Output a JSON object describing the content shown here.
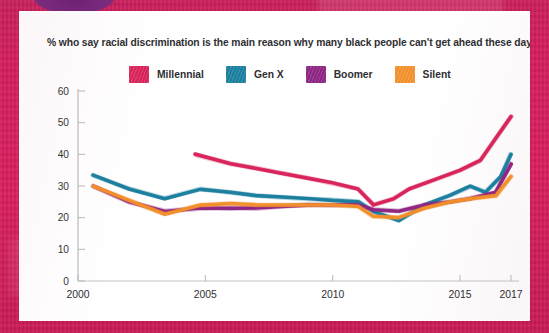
{
  "chart_data": {
    "type": "line",
    "title": "% who say racial discrimination is the main reason why many black people can't get ahead these days",
    "xlabel": "",
    "ylabel": "",
    "xlim": [
      2000,
      2017
    ],
    "ylim": [
      0,
      60
    ],
    "grid": false,
    "legend_position": "top",
    "y_ticks": [
      "60",
      "50",
      "40",
      "30",
      "20",
      "10",
      "0"
    ],
    "y_tick_values": [
      60,
      50,
      40,
      30,
      20,
      10,
      0
    ],
    "x_ticks": [
      "2000",
      "2005",
      "2010",
      "2015",
      "2017"
    ],
    "x_tick_values": [
      2000,
      2005,
      2010,
      2015,
      2017
    ],
    "series": [
      {
        "name": "Millennial",
        "color": "#d8235a",
        "x": [
          2004.6,
          2006,
          2007,
          2008,
          2009,
          2010,
          2011,
          2011.6,
          2012.4,
          2013,
          2014,
          2015,
          2015.8,
          2016.4,
          2017
        ],
        "values": [
          40,
          37,
          35.5,
          34,
          32.5,
          31,
          29,
          24,
          26,
          29,
          32,
          35,
          38,
          45,
          52
        ]
      },
      {
        "name": "Gen X",
        "color": "#1b7f9e",
        "x": [
          2000.6,
          2002,
          2003.4,
          2004.8,
          2006,
          2007,
          2008,
          2009,
          2010,
          2011,
          2011.6,
          2012.6,
          2013.6,
          2014.6,
          2015.4,
          2016,
          2016.6,
          2017
        ],
        "values": [
          33.5,
          29,
          26,
          29,
          28,
          27,
          26.5,
          26,
          25.5,
          25,
          22,
          19,
          24,
          27,
          30,
          28,
          33,
          40
        ]
      },
      {
        "name": "Boomer",
        "color": "#8f2582",
        "x": [
          2000.6,
          2002,
          2003.4,
          2004.8,
          2006,
          2007,
          2008,
          2009,
          2010,
          2011,
          2011.6,
          2012.6,
          2013.6,
          2014.6,
          2015.4,
          2016.4,
          2017
        ],
        "values": [
          30,
          25,
          22,
          23,
          23,
          23,
          23.5,
          24,
          24,
          24,
          22.5,
          22,
          24,
          25,
          26,
          28,
          37
        ]
      },
      {
        "name": "Silent",
        "color": "#f2902c",
        "x": [
          2000.6,
          2002,
          2003.4,
          2004.8,
          2006,
          2007,
          2008,
          2009,
          2010,
          2011,
          2011.6,
          2012.6,
          2013.6,
          2014.6,
          2015.4,
          2016.4,
          2017
        ],
        "values": [
          30,
          25.5,
          21,
          24,
          24.5,
          24,
          24,
          24,
          24,
          23.5,
          20.5,
          20,
          23,
          25,
          26,
          27,
          33
        ]
      }
    ]
  },
  "legend": {
    "items": [
      {
        "label": "Millennial",
        "color": "#d8235a"
      },
      {
        "label": "Gen X",
        "color": "#1b7f9e"
      },
      {
        "label": "Boomer",
        "color": "#8f2582"
      },
      {
        "label": "Silent",
        "color": "#f2902c"
      }
    ]
  },
  "frame": {
    "border_color": "#d81e5b",
    "blob_color": "#7a2a7e",
    "card_color": "#fdfdfd"
  }
}
